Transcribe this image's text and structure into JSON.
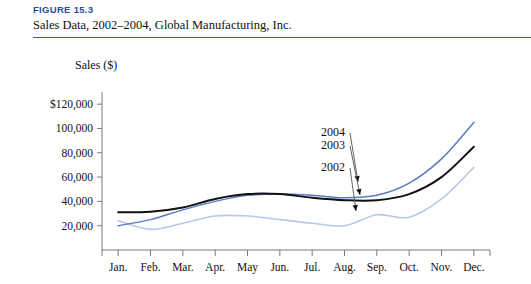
{
  "figure": {
    "number": "FIGURE 15.3",
    "caption": "Sales Data, 2002–2004, Global Manufacturing, Inc.",
    "rule_color": "#3a5bab"
  },
  "chart_data": {
    "type": "line",
    "title": "Sales Data, 2002–2004, Global Manufacturing, Inc.",
    "xlabel": "",
    "ylabel": "Sales ($)",
    "categories": [
      "Jan.",
      "Feb.",
      "Mar.",
      "Apr.",
      "May",
      "Jun.",
      "Jul.",
      "Aug.",
      "Sep.",
      "Oct.",
      "Nov.",
      "Dec."
    ],
    "ytick_labels": [
      "$120,000",
      "100,000",
      "80,000",
      "60,000",
      "40,000",
      "20,000"
    ],
    "ytick_values": [
      120000,
      100000,
      80000,
      60000,
      40000,
      20000
    ],
    "ylim": [
      0,
      130000
    ],
    "grid": false,
    "legend_position": "inline-annotation",
    "series": [
      {
        "name": "2004",
        "color": "#5b79c0",
        "values": [
          20000,
          25000,
          33000,
          40000,
          45000,
          46000,
          45000,
          43000,
          45000,
          55000,
          75000,
          105000
        ]
      },
      {
        "name": "2003",
        "color": "#111111",
        "values": [
          31000,
          31500,
          35000,
          42000,
          46000,
          46000,
          43000,
          41000,
          41000,
          46000,
          60000,
          85000
        ]
      },
      {
        "name": "2002",
        "color": "#b9c8e8",
        "values": [
          24000,
          17000,
          22000,
          28000,
          28000,
          25000,
          22000,
          20000,
          29000,
          27000,
          42000,
          68000
        ]
      }
    ],
    "annotations": [
      {
        "label": "2004",
        "series": "2004"
      },
      {
        "label": "2003",
        "series": "2003"
      },
      {
        "label": "2002",
        "series": "2002"
      }
    ]
  }
}
